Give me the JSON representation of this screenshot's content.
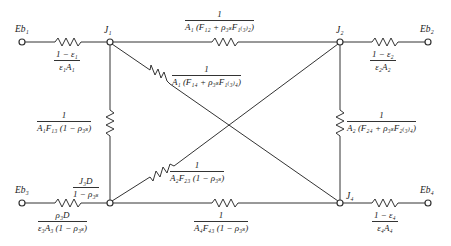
{
  "nodes": {
    "Eb1": "Eb₁",
    "Eb2": "Eb₂",
    "Eb3": "Eb₃",
    "Eb4": "Eb₄",
    "J1": "J₁",
    "J2": "J₂",
    "J4": "J₄"
  },
  "resistors": {
    "surface1": {
      "num": "1 − ε₁",
      "den": "ε₁A₁"
    },
    "surface2": {
      "num": "1 − ε₂",
      "den": "ε₂A₂"
    },
    "surface3": {
      "num": "ρ₃D",
      "den": "ε₃A₃ (1 − ρ₃ₛ)"
    },
    "surface4": {
      "num": "1 − ε₄",
      "den": "ε₄A₄"
    },
    "r12": {
      "num": "1",
      "den": "A₁ (F₁₂ + ρ₃ₛF₁₍₃₎₂)"
    },
    "r14": {
      "num": "1",
      "den": "A₁ (F₁₄ + ρ₃ₛF₁₍₃₎₄)"
    },
    "r13": {
      "num": "1",
      "den": "A₁F₁₃ (1 − ρ₃ₛ)"
    },
    "r24": {
      "num": "1",
      "den": "A₂ (F₂₄ + ρ₃ₛF₂₍₃₎₄)"
    },
    "r23": {
      "num": "1",
      "den": "A₂F₂₃ (1 − ρ₃ₛ)"
    },
    "r43": {
      "num": "1",
      "den": "A₄F₄₃ (1 − ρ₃ₛ)"
    },
    "source3": {
      "num": "J₃D",
      "den": "1 − ρ₃ₛ"
    }
  }
}
